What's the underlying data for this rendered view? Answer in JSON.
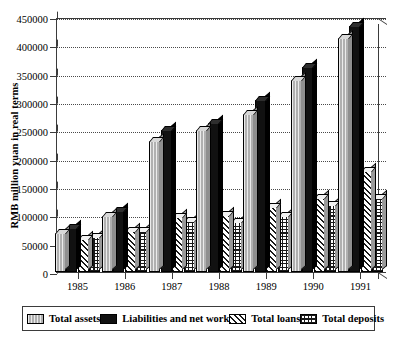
{
  "chart_data": {
    "type": "bar",
    "title": "",
    "xlabel": "",
    "ylabel": "RMB million yuan in real terms",
    "ylim": [
      0,
      450000
    ],
    "ytick_step": 50000,
    "yticks": [
      "0",
      "50000",
      "100000",
      "150000",
      "200000",
      "250000",
      "300000",
      "350000",
      "400000",
      "450000"
    ],
    "categories": [
      "1985",
      "1986",
      "1987",
      "1988",
      "1989",
      "1990",
      "1991"
    ],
    "grid": true,
    "legend_position": "bottom",
    "series": [
      {
        "name": "Total assets",
        "values": [
          69000,
          98000,
          231000,
          250000,
          278000,
          338000,
          413000
        ]
      },
      {
        "name": "Liabilities and net work",
        "values": [
          78000,
          108000,
          250000,
          263000,
          303000,
          362000,
          434000
        ]
      },
      {
        "name": "Total loans",
        "values": [
          58000,
          73000,
          97000,
          101000,
          114000,
          130000,
          179000
        ]
      },
      {
        "name": "Total deposits",
        "values": [
          62000,
          73000,
          90000,
          89000,
          98000,
          118000,
          131000
        ]
      }
    ]
  },
  "legend": {
    "items": [
      {
        "label": "Total assets",
        "pattern": "light-gray-vertical-lines",
        "color": "#b0b0b0"
      },
      {
        "label": "Liabilities and net work",
        "pattern": "solid-black",
        "color": "#111111"
      },
      {
        "label": "Total loans",
        "pattern": "diagonal-hatch",
        "color": "#ffffff"
      },
      {
        "label": "Total deposits",
        "pattern": "grid-crosshatch",
        "color": "#ffffff"
      }
    ]
  },
  "style": {
    "axis_color": "#3b3b3b",
    "grid_color": "#4a4a4a",
    "background": "#ffffff"
  }
}
